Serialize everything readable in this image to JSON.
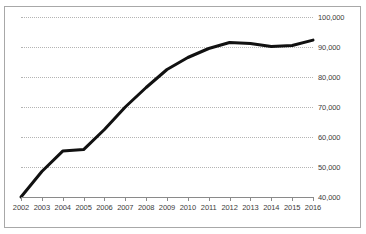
{
  "chart_data": {
    "type": "line",
    "title": "",
    "subtitle": "",
    "xlabel": "",
    "ylabel": "",
    "x": [
      2002,
      2003,
      2004,
      2005,
      2006,
      2007,
      2008,
      2009,
      2010,
      2011,
      2012,
      2013,
      2014,
      2015,
      2016
    ],
    "categories": [
      "2002",
      "2003",
      "2004",
      "2005",
      "2006",
      "2007",
      "2008",
      "2009",
      "2010",
      "2011",
      "2012",
      "2013",
      "2014",
      "2015",
      "2016"
    ],
    "values": [
      40000,
      48500,
      55300,
      55800,
      62500,
      70000,
      76500,
      82500,
      86500,
      89500,
      91500,
      91200,
      90200,
      90500,
      92300
    ],
    "series": [
      {
        "name": "",
        "values": [
          40000,
          48500,
          55300,
          55800,
          62500,
          70000,
          76500,
          82500,
          86500,
          89500,
          91500,
          91200,
          90200,
          90500,
          92300
        ]
      }
    ],
    "ylim": [
      40000,
      100000
    ],
    "ytick_values": [
      100000,
      90000,
      80000,
      70000,
      60000,
      50000,
      40000
    ],
    "ytick_labels": [
      "100,000",
      "90,000",
      "80,000",
      "70,000",
      "60,000",
      "50,000",
      "40,000"
    ],
    "yaxis_position": "right",
    "grid": true,
    "grid_style": "dotted",
    "grid_color": "#b4b4b4",
    "legend": false,
    "legend_position": "none",
    "line_color": "#111111",
    "line_width": 3,
    "markers": false,
    "annotations": [],
    "frame_color": "#a8a8a8",
    "axis_color": "#8a8a8a",
    "background_color": "#ffffff"
  }
}
